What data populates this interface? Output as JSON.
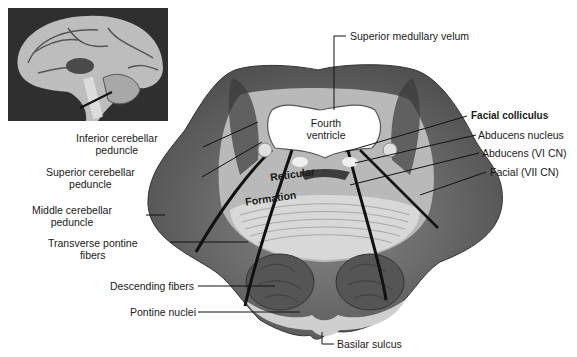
{
  "figure": {
    "inset": {
      "description": "midsagittal brain photograph",
      "pointer": "pons level"
    },
    "labels_left": [
      {
        "id": "inferior-cerebellar-peduncle",
        "line1": "Inferior cerebellar",
        "line2": "peduncle"
      },
      {
        "id": "superior-cerebellar-peduncle",
        "line1": "Superior cerebellar",
        "line2": "peduncle"
      },
      {
        "id": "middle-cerebellar-peduncle",
        "line1": "Middle cerebellar",
        "line2": "peduncle"
      },
      {
        "id": "transverse-pontine-fibers",
        "line1": "Transverse pontine",
        "line2": "fibers"
      },
      {
        "id": "descending-fibers",
        "line1": "Descending fibers"
      },
      {
        "id": "pontine-nuclei",
        "line1": "Pontine nuclei"
      }
    ],
    "labels_right": [
      {
        "id": "superior-medullary-velum",
        "text": "Superior medullary velum"
      },
      {
        "id": "facial-colliculus",
        "text": "Facial colliculus"
      },
      {
        "id": "abducens-nucleus",
        "text": "Abducens nucleus"
      },
      {
        "id": "abducens-nerve",
        "text": "Abducens (VI CN)"
      },
      {
        "id": "facial-nerve",
        "text": "Facial (VII CN)"
      },
      {
        "id": "basilar-sulcus",
        "text": "Basilar sulcus"
      }
    ],
    "internal_labels": {
      "fourth_ventricle_1": "Fourth",
      "fourth_ventricle_2": "ventricle",
      "reticular": "Reticular",
      "formation": "Formation"
    }
  }
}
